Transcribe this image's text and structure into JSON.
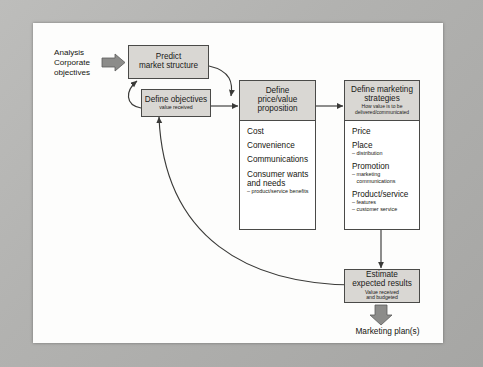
{
  "diagram": {
    "colors": {
      "box_fill": "#d9d7d3",
      "box_stroke": "#4a4a48",
      "panel_fill": "#ffffff",
      "text": "#1a1a18",
      "arrow": "#3a3a38",
      "scan_border": "#b2b2b0",
      "page": "#fdfdfc"
    },
    "input": {
      "line1": "Analysis",
      "line2": "Corporate",
      "line3": "objectives",
      "arrow_icon": "block-arrow-right-icon"
    },
    "nodes": {
      "predict": {
        "title_line1": "Predict",
        "title_line2": "market structure"
      },
      "objectives": {
        "title": "Define objectives",
        "subtitle": "value received"
      },
      "price_value": {
        "title_line1": "Define",
        "title_line2": "price/value",
        "title_line3": "proposition",
        "items": [
          {
            "label": "Cost",
            "sub": ""
          },
          {
            "label": "Convenience",
            "sub": ""
          },
          {
            "label": "Communications",
            "sub": ""
          },
          {
            "label": "Consumer wants and needs",
            "sub": "– product/service benefits"
          }
        ]
      },
      "marketing_strategies": {
        "title_line1": "Define marketing",
        "title_line2": "strategies",
        "subtitle_line1": "How value is to be",
        "subtitle_line2": "delivered/communicated",
        "items": [
          {
            "label": "Price",
            "sub": ""
          },
          {
            "label": "Place",
            "sub": "– distribution"
          },
          {
            "label": "Promotion",
            "sub": "– marketing\n   communications"
          },
          {
            "label": "Product/service",
            "sub": "– features\n– customer service"
          }
        ]
      },
      "estimate": {
        "title_line1": "Estimate",
        "title_line2": "expected results",
        "subtitle_line1": "Value received",
        "subtitle_line2": "and budgeted"
      }
    },
    "output": {
      "label": "Marketing plan(s)",
      "arrow_icon": "block-arrow-down-icon"
    },
    "connectors": [
      {
        "name": "input-to-predict",
        "type": "block-arrow",
        "from": "input",
        "to": "predict"
      },
      {
        "name": "predict-to-objectives",
        "type": "curved-arrow",
        "from": "predict",
        "to": "objectives"
      },
      {
        "name": "objectives-to-predict",
        "type": "curved-arrow",
        "from": "objectives",
        "to": "predict"
      },
      {
        "name": "objectives-to-price-value",
        "type": "straight-arrow",
        "from": "objectives",
        "to": "price_value"
      },
      {
        "name": "price-value-to-strategies",
        "type": "straight-arrow",
        "from": "price_value",
        "to": "marketing_strategies"
      },
      {
        "name": "strategies-to-estimate",
        "type": "straight-arrow",
        "from": "marketing_strategies",
        "to": "estimate"
      },
      {
        "name": "estimate-feedback-to-objectives",
        "type": "curved-arrow",
        "from": "estimate",
        "to": "objectives"
      },
      {
        "name": "estimate-to-output",
        "type": "block-arrow",
        "from": "estimate",
        "to": "output"
      }
    ]
  }
}
